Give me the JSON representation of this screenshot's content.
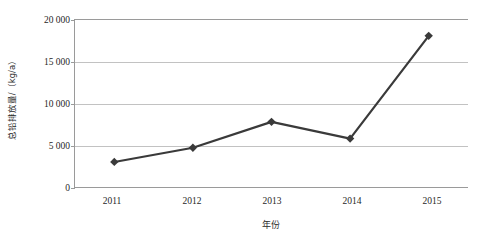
{
  "chart_data": {
    "type": "line",
    "title": "",
    "xlabel": "年份",
    "ylabel": "总铅排放量/（kg/a）",
    "categories": [
      "2011",
      "2012",
      "2013",
      "2014",
      "2015"
    ],
    "values": [
      3000,
      4700,
      7800,
      5800,
      18100
    ],
    "series": [
      {
        "name": "总铅排放量",
        "values": [
          3000,
          4700,
          7800,
          5800,
          18100
        ],
        "color": "#3a3a3a",
        "marker": "diamond"
      }
    ],
    "ylim": [
      0,
      20000
    ],
    "ytick_values": [
      0,
      5000,
      10000,
      15000,
      20000
    ],
    "ytick_labels": [
      "0",
      "5 000",
      "10 000",
      "15 000",
      "20 000"
    ],
    "grid": true,
    "grid_axis": "y",
    "grid_color": "#c2c2c2",
    "legend": false,
    "legend_position": "none",
    "axis_color": "#9a9a9a",
    "background": "#ffffff"
  }
}
